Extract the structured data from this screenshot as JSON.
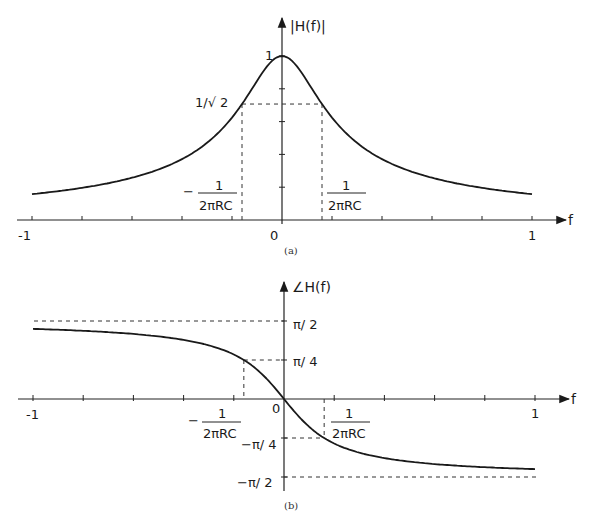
{
  "chart_data": [
    {
      "id": "a",
      "type": "line",
      "title": "",
      "caption": "(a)",
      "xlabel": "f",
      "ylabel": "|H(f)|",
      "xlim": [
        -1,
        1
      ],
      "ylim": [
        0,
        1
      ],
      "x_ticks": [
        -1,
        -0.8,
        -0.6,
        -0.4,
        -0.2,
        0,
        0.2,
        0.4,
        0.6,
        0.8,
        1
      ],
      "x_tick_labels": {
        "-1": "-1",
        "0": "0",
        "1": "1"
      },
      "y_ticks": [
        0.2,
        0.4,
        0.6,
        0.8,
        1
      ],
      "cutoff_frequency": 0.16,
      "annotations": {
        "y_one": "1",
        "y_half_power": "1/√ 2",
        "fc_neg_minus": "−",
        "fc_num": "1",
        "fc_den": "2πRC",
        "origin": "0"
      },
      "formula": "1/sqrt(1+(f/fc)^2)",
      "x": [
        -1,
        -0.8,
        -0.6,
        -0.4,
        -0.3,
        -0.2,
        -0.16,
        -0.1,
        -0.05,
        0,
        0.05,
        0.1,
        0.16,
        0.2,
        0.3,
        0.4,
        0.6,
        0.8,
        1
      ],
      "values": [
        0.158,
        0.196,
        0.258,
        0.371,
        0.471,
        0.625,
        0.707,
        0.848,
        0.954,
        1.0,
        0.954,
        0.848,
        0.707,
        0.625,
        0.471,
        0.371,
        0.258,
        0.196,
        0.158
      ]
    },
    {
      "id": "b",
      "type": "line",
      "title": "",
      "caption": "(b)",
      "xlabel": "f",
      "ylabel": "∠H(f)",
      "xlim": [
        -1,
        1
      ],
      "ylim": [
        -1.5708,
        1.5708
      ],
      "x_ticks": [
        -1,
        -0.8,
        -0.6,
        -0.4,
        -0.2,
        0,
        0.2,
        0.4,
        0.6,
        0.8,
        1
      ],
      "x_tick_labels": {
        "-1": "-1",
        "0": "0",
        "1": "1"
      },
      "y_tick_labels": [
        "π/ 2",
        "π/ 4",
        "−π/ 4",
        "−π/ 2"
      ],
      "y_tick_values": [
        1.5708,
        0.7854,
        -0.7854,
        -1.5708
      ],
      "cutoff_frequency": 0.16,
      "annotations": {
        "fc_neg_minus": "−",
        "fc_num": "1",
        "fc_den": "2πRC",
        "origin": "0"
      },
      "formula": "-atan(f/fc)",
      "x": [
        -1,
        -0.8,
        -0.6,
        -0.4,
        -0.3,
        -0.2,
        -0.16,
        -0.1,
        -0.05,
        0,
        0.05,
        0.1,
        0.16,
        0.2,
        0.3,
        0.4,
        0.6,
        0.8,
        1
      ],
      "values": [
        1.412,
        1.373,
        1.31,
        1.19,
        1.081,
        0.896,
        0.785,
        0.559,
        0.303,
        0,
        -0.303,
        -0.559,
        -0.785,
        -0.896,
        -1.081,
        -1.19,
        -1.31,
        -1.373,
        -1.412
      ]
    }
  ]
}
